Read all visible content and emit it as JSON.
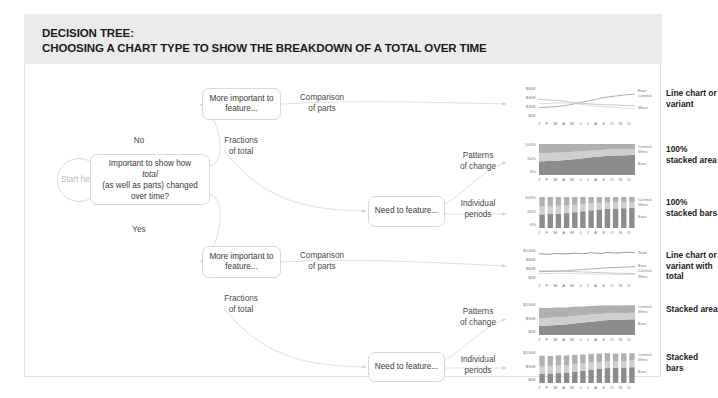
{
  "header": {
    "title_line1": "DECISION TREE:",
    "title_line2": "CHOOSING A CHART TYPE TO SHOW THE BREAKDOWN OF A TOTAL OVER TIME"
  },
  "nodes": {
    "start": "Start\nhere",
    "question_a": "Important to show how ",
    "question_b": "total",
    "question_c": " (as well as parts)\nchanged over time?",
    "more_important_top": "More important\nto feature...",
    "need_feature_top": "Need to\nfeature...",
    "more_important_bottom": "More important\nto feature...",
    "need_feature_bottom": "Need to\nfeature..."
  },
  "edge_labels": {
    "no": "No",
    "yes": "Yes",
    "comparison_top": "Comparison\nof parts",
    "fractions_top": "Fractions\nof total",
    "patterns_top": "Patterns\nof change",
    "individual_top": "Individual\nperiods",
    "comparison_bottom": "Comparison\nof parts",
    "fractions_bottom": "Fractions\nof total",
    "patterns_bottom": "Patterns\nof change",
    "individual_bottom": "Individual\nperiods"
  },
  "months": "J F M A M J J A S O N D",
  "colors": {
    "header_band": "#ebebeb",
    "node_border": "#d9d9d9",
    "text": "#3a3a3a",
    "series_east": "#8c8c8c",
    "series_central": "#b0b0b0",
    "series_west": "#cfcfcf",
    "series_total": "#707070"
  },
  "chart_data": [
    {
      "type": "line",
      "title": "Line chart or variant",
      "ylabel": "",
      "xlabel": "",
      "yticks": [
        "$60K",
        "$40K",
        "$20K",
        "$0K"
      ],
      "ylim": [
        0,
        60
      ],
      "categories": [
        "J",
        "F",
        "M",
        "A",
        "M",
        "J",
        "J",
        "A",
        "S",
        "O",
        "N",
        "D"
      ],
      "legend": [
        "East",
        "Central",
        "West"
      ],
      "legend_position": "right",
      "grid": false,
      "series": [
        {
          "name": "East",
          "values": [
            22,
            23,
            24,
            26,
            29,
            33,
            36,
            40,
            43,
            45,
            47,
            48
          ]
        },
        {
          "name": "Central",
          "values": [
            38,
            37,
            36,
            34,
            32,
            30,
            29,
            28,
            27,
            27,
            26,
            26
          ]
        },
        {
          "name": "West",
          "values": [
            30,
            30,
            31,
            31,
            30,
            28,
            26,
            24,
            23,
            22,
            21,
            20
          ]
        }
      ]
    },
    {
      "type": "area",
      "title": "100% stacked area",
      "yticks": [
        "100%",
        "50%",
        "0%"
      ],
      "ylim": [
        0,
        100
      ],
      "categories": [
        "J",
        "F",
        "M",
        "A",
        "M",
        "J",
        "J",
        "A",
        "S",
        "O",
        "N",
        "D"
      ],
      "legend": [
        "Central",
        "West",
        "East"
      ],
      "legend_position": "right",
      "grid": false,
      "stacked": true,
      "percent": true,
      "series": [
        {
          "name": "East",
          "values": [
            44,
            45,
            46,
            48,
            51,
            54,
            57,
            60,
            62,
            63,
            64,
            65
          ]
        },
        {
          "name": "West",
          "values": [
            26,
            26,
            26,
            25,
            24,
            23,
            22,
            21,
            20,
            20,
            20,
            19
          ]
        },
        {
          "name": "Central",
          "values": [
            30,
            29,
            28,
            27,
            25,
            23,
            21,
            19,
            18,
            17,
            16,
            16
          ]
        }
      ]
    },
    {
      "type": "bar",
      "title": "100% stacked bars",
      "yticks": [
        "100%",
        "50%",
        "0%"
      ],
      "ylim": [
        0,
        100
      ],
      "categories": [
        "J",
        "F",
        "M",
        "A",
        "M",
        "J",
        "J",
        "A",
        "S",
        "O",
        "N",
        "D"
      ],
      "legend": [
        "Central",
        "West",
        "East"
      ],
      "legend_position": "right",
      "grid": false,
      "stacked": true,
      "percent": true,
      "series": [
        {
          "name": "East",
          "values": [
            44,
            45,
            46,
            48,
            51,
            54,
            57,
            60,
            62,
            63,
            64,
            65
          ]
        },
        {
          "name": "West",
          "values": [
            26,
            26,
            26,
            25,
            24,
            23,
            22,
            21,
            20,
            20,
            20,
            19
          ]
        },
        {
          "name": "Central",
          "values": [
            30,
            29,
            28,
            27,
            25,
            23,
            21,
            19,
            18,
            17,
            16,
            16
          ]
        }
      ]
    },
    {
      "type": "line",
      "title": "Line chart or variant with total",
      "yticks": [
        "$100K",
        "$60K",
        "$60K",
        "$0K"
      ],
      "ylim": [
        0,
        100
      ],
      "categories": [
        "J",
        "F",
        "M",
        "A",
        "M",
        "J",
        "J",
        "A",
        "S",
        "O",
        "N",
        "D"
      ],
      "legend": [
        "Total",
        "East",
        "Central",
        "West"
      ],
      "legend_position": "right",
      "grid": false,
      "series": [
        {
          "name": "Total",
          "values": [
            88,
            86,
            89,
            87,
            90,
            88,
            91,
            89,
            92,
            90,
            93,
            91
          ]
        },
        {
          "name": "East",
          "values": [
            30,
            31,
            32,
            33,
            35,
            37,
            39,
            41,
            43,
            44,
            45,
            46
          ]
        },
        {
          "name": "Central",
          "values": [
            33,
            32,
            32,
            31,
            30,
            29,
            28,
            27,
            26,
            25,
            25,
            24
          ]
        },
        {
          "name": "West",
          "values": [
            25,
            24,
            25,
            24,
            24,
            23,
            23,
            22,
            22,
            21,
            21,
            21
          ]
        }
      ]
    },
    {
      "type": "area",
      "title": "Stacked area",
      "yticks": [
        "$100K",
        "$50K",
        "$0K"
      ],
      "ylim": [
        0,
        100
      ],
      "categories": [
        "J",
        "F",
        "M",
        "A",
        "M",
        "J",
        "J",
        "A",
        "S",
        "O",
        "N",
        "D"
      ],
      "legend": [
        "Central",
        "West",
        "East"
      ],
      "legend_position": "right",
      "grid": false,
      "stacked": true,
      "series": [
        {
          "name": "East",
          "values": [
            30,
            31,
            32,
            34,
            37,
            40,
            43,
            46,
            48,
            49,
            50,
            51
          ]
        },
        {
          "name": "West",
          "values": [
            25,
            24,
            25,
            24,
            24,
            23,
            23,
            22,
            22,
            21,
            21,
            21
          ]
        },
        {
          "name": "Central",
          "values": [
            33,
            32,
            32,
            31,
            30,
            29,
            28,
            27,
            26,
            25,
            25,
            24
          ]
        }
      ]
    },
    {
      "type": "bar",
      "title": "Stacked bars",
      "yticks": [
        "$100K",
        "$50K",
        "$0K"
      ],
      "ylim": [
        0,
        100
      ],
      "categories": [
        "J",
        "F",
        "M",
        "A",
        "M",
        "J",
        "J",
        "A",
        "S",
        "O",
        "N",
        "D"
      ],
      "legend": [
        "Central",
        "West",
        "East"
      ],
      "legend_position": "right",
      "grid": false,
      "stacked": true,
      "series": [
        {
          "name": "East",
          "values": [
            30,
            31,
            32,
            34,
            37,
            40,
            43,
            46,
            48,
            49,
            50,
            51
          ]
        },
        {
          "name": "West",
          "values": [
            25,
            24,
            25,
            24,
            24,
            23,
            23,
            22,
            22,
            21,
            21,
            21
          ]
        },
        {
          "name": "Central",
          "values": [
            33,
            32,
            32,
            31,
            30,
            29,
            28,
            27,
            26,
            25,
            25,
            24
          ]
        }
      ]
    }
  ]
}
